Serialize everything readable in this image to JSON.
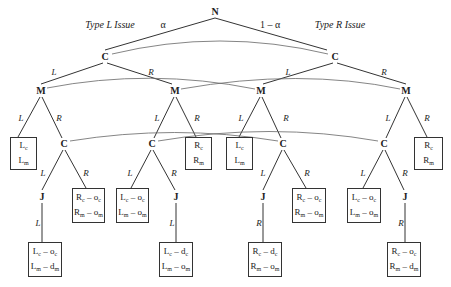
{
  "diagram": {
    "type": "extensive-form game tree",
    "root": {
      "label": "N"
    },
    "top_labels": {
      "left_issue": "Type L Issue",
      "right_issue": "Type R Issue",
      "left_prob": "α",
      "right_prob": "1 – α"
    },
    "players": {
      "nature": "N",
      "c": "C",
      "m": "M",
      "j": "J"
    },
    "edge_labels": {
      "L": "L",
      "R": "R"
    },
    "payoffs": {
      "p_lc_lm": [
        "L",
        "c",
        "",
        "L",
        "m",
        ""
      ],
      "p_rc_rm": [
        "R",
        "c",
        "",
        "R",
        "m",
        ""
      ],
      "p_rc_oc_rm_om": [
        "R",
        "c",
        " – o",
        "R",
        "m",
        " – o"
      ],
      "p_lc_oc_lm_om": [
        "L",
        "c",
        " – o",
        "L",
        "m",
        " – o"
      ],
      "p_lc_oc_lm_dm": [
        "L",
        "c",
        " – o",
        "L",
        "m",
        " – d"
      ],
      "p_lc_dc_lm_om": [
        "L",
        "c",
        " – d",
        "L",
        "m",
        " – o"
      ],
      "p_rc_dc_rm_om": [
        "R",
        "c",
        " – d",
        "R",
        "m",
        " – o"
      ],
      "p_rc_oc_rm_dm": [
        "R",
        "c",
        " – o",
        "R",
        "m",
        " – d"
      ]
    },
    "terminal_boxes": [
      {
        "id": "t1",
        "line1": "Lc",
        "line2": "Lm"
      },
      {
        "id": "t2",
        "line1": "Rc – oc",
        "line2": "Rm – om"
      },
      {
        "id": "t3",
        "line1": "Lc – oc",
        "line2": "Lm – dm"
      },
      {
        "id": "t4",
        "line1": "Lc – oc",
        "line2": "Lm – om"
      },
      {
        "id": "t5",
        "line1": "Lc – dc",
        "line2": "Lm – om"
      },
      {
        "id": "t6",
        "line1": "Rc",
        "line2": "Rm"
      },
      {
        "id": "t7",
        "line1": "Lc",
        "line2": "Lm"
      },
      {
        "id": "t8",
        "line1": "Rc – dc",
        "line2": "Rm – om"
      },
      {
        "id": "t9",
        "line1": "Rc – oc",
        "line2": "Rm – om"
      },
      {
        "id": "t10",
        "line1": "Lc – oc",
        "line2": "Lm – om"
      },
      {
        "id": "t11",
        "line1": "Rc – oc",
        "line2": "Rm – dm"
      },
      {
        "id": "t12",
        "line1": "Rc",
        "line2": "Rm"
      }
    ],
    "sub": {
      "c": "c",
      "m": "m"
    },
    "ops": {
      "o": " – o",
      "d": " – d"
    }
  }
}
